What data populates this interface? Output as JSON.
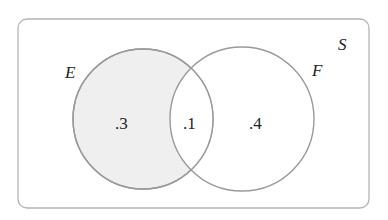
{
  "diagram": {
    "type": "venn",
    "universe_label": "S",
    "sets": [
      {
        "label": "E",
        "shaded": true
      },
      {
        "label": "F",
        "shaded": false
      }
    ],
    "regions": {
      "e_only": ".3",
      "intersection": ".1",
      "f_only": ".4"
    },
    "colors": {
      "outline": "#9a9a9a",
      "shade": "#efefef",
      "text": "#222222"
    }
  }
}
